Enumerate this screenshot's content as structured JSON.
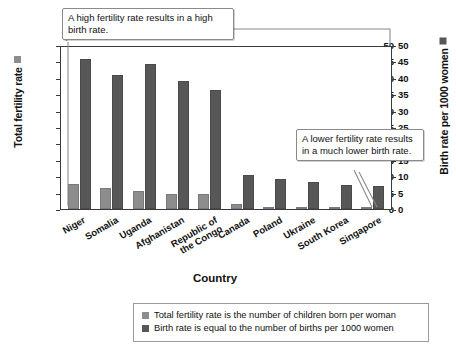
{
  "chart_data": {
    "type": "bar",
    "title": "",
    "xlabel": "Country",
    "categories": [
      "Niger",
      "Somalia",
      "Uganda",
      "Afghanistan",
      "Republic of\nthe Congo",
      "Canada",
      "Poland",
      "Ukraine",
      "South Korea",
      "Singapore"
    ],
    "series": [
      {
        "name": "Total fertility rate",
        "axis": "left",
        "color": "#8d8d8d",
        "values": [
          7.6,
          6.4,
          5.5,
          4.7,
          4.7,
          1.4,
          0.7,
          0.6,
          0.4,
          0.4
        ]
      },
      {
        "name": "Birth rate per 1000 women",
        "axis": "right",
        "color": "#575757",
        "values": [
          45.7,
          40.8,
          44.1,
          39.0,
          36.4,
          10.5,
          9.0,
          8.2,
          7.3,
          6.9
        ]
      }
    ],
    "axes": {
      "left": {
        "label": "Total fertility rate",
        "ticks": [
          "50",
          "45",
          "40",
          "35",
          "30",
          "25",
          "20",
          "15",
          "10",
          "5",
          "0"
        ],
        "min": 0,
        "max": 50,
        "step": 5
      },
      "right": {
        "label": "Birth rate per 1000 women",
        "ticks": [
          "50",
          "45",
          "40",
          "35",
          "30",
          "25",
          "20",
          "15",
          "10",
          "5",
          "0"
        ],
        "min": 0,
        "max": 50,
        "step": 5
      }
    },
    "grid": false,
    "legend_position": "bottom"
  },
  "annotations": {
    "high": "A high fertility rate results in a high birth rate.",
    "low": "A lower fertility rate results in a much lower birth rate."
  },
  "legend": {
    "entries": [
      "Total fertility rate is the number of children born per woman",
      "Birth rate is equal to the number of births per 1000 women"
    ]
  },
  "colors": {
    "fertility": "#8d8d8d",
    "birth": "#575757",
    "axis": "#3a3a3a",
    "callout_border": "#8a8a8a"
  }
}
